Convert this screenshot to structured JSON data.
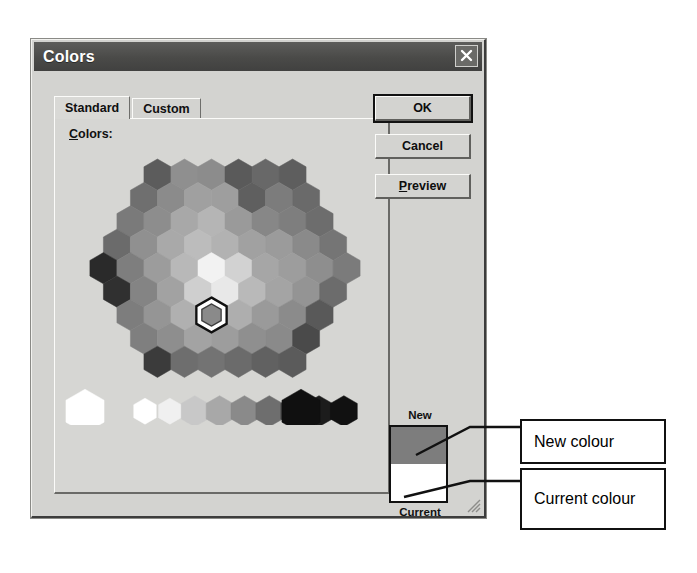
{
  "dialog": {
    "title": "Colors",
    "close_icon": "close-x-icon",
    "tabs": [
      {
        "label": "Standard",
        "selected": true
      },
      {
        "label": "Custom",
        "selected": false
      }
    ],
    "colors_label": "Colors:",
    "colors_label_mnemonic": "C",
    "buttons": [
      {
        "label": "OK",
        "default": true
      },
      {
        "label": "Cancel",
        "default": false
      },
      {
        "label": "Preview",
        "default": false,
        "mnemonic": "P"
      }
    ],
    "swatch": {
      "new_label": "New",
      "current_label": "Current",
      "new_color": "#7d7d7d",
      "current_color": "#ffffff"
    },
    "colors_palette": {
      "selected_index": 52,
      "grid_rows": [
        {
          "count": 6,
          "colors": [
            "#5c5c5c",
            "#8f8f8f",
            "#8c8c8c",
            "#5a5a5a",
            "#686868",
            "#5e5e5e"
          ]
        },
        {
          "count": 7,
          "colors": [
            "#6f6f6f",
            "#8b8b8b",
            "#a0a0a0",
            "#9e9e9e",
            "#5f5f5f",
            "#7c7c7c",
            "#6a6a6a"
          ]
        },
        {
          "count": 8,
          "colors": [
            "#7a7a7a",
            "#8d8d8d",
            "#a8a8a8",
            "#b5b5b5",
            "#9a9a9a",
            "#878787",
            "#7e7e7e",
            "#6d6d6d"
          ]
        },
        {
          "count": 9,
          "colors": [
            "#6b6b6b",
            "#909090",
            "#a9a9a9",
            "#bcbcbc",
            "#b2b2b2",
            "#a1a1a1",
            "#9b9b9b",
            "#8a8a8a",
            "#757575"
          ]
        },
        {
          "count": 10,
          "colors": [
            "#2a2a2a",
            "#7e7e7e",
            "#9c9c9c",
            "#b8b8b8",
            "#f2f2f2",
            "#d2d2d2",
            "#a6a6a6",
            "#9d9d9d",
            "#8e8e8e",
            "#7b7b7b"
          ]
        },
        {
          "count": 9,
          "colors": [
            "#303030",
            "#848484",
            "#a2a2a2",
            "#cfcfcf",
            "#e8e8e8",
            "#b9b9b9",
            "#a4a4a4",
            "#949494",
            "#6c6c6c"
          ]
        },
        {
          "count": 8,
          "colors": [
            "#7d7d7d",
            "#959595",
            "#b0b0b0",
            "#c6c6c6",
            "#aeaeae",
            "#9a9a9a",
            "#8b8b8b",
            "#595959"
          ]
        },
        {
          "count": 7,
          "colors": [
            "#7f7f7f",
            "#8e8e8e",
            "#a3a3a3",
            "#9d9d9d",
            "#8f8f8f",
            "#8a8a8a",
            "#4a4a4a"
          ]
        },
        {
          "count": 6,
          "colors": [
            "#3b3b3b",
            "#6e6e6e",
            "#737373",
            "#6b6b6b",
            "#616161",
            "#5b5b5b"
          ]
        }
      ],
      "gray_strip": [
        "#ffffff",
        "#f0f0f0",
        "#c8c8c8",
        "#a8a8a8",
        "#8a8a8a",
        "#6e6e6e",
        "#4a4a4a",
        "#1c1c1c",
        "#111111"
      ],
      "single_white": "#ffffff",
      "single_black": "#101010"
    }
  },
  "annotations": [
    {
      "name": "new-colour",
      "text": "New colour"
    },
    {
      "name": "current-colour",
      "text": "Current colour"
    }
  ]
}
